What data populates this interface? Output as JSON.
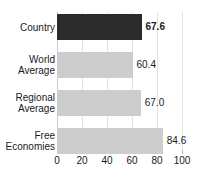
{
  "chart_data": {
    "type": "bar",
    "orientation": "horizontal",
    "title": "",
    "xlabel": "",
    "ylabel": "",
    "xlim": [
      0,
      100
    ],
    "xticks": [
      "0",
      "20",
      "40",
      "60",
      "80",
      "100"
    ],
    "xtick_values": [
      0,
      20,
      40,
      60,
      80,
      100
    ],
    "grid": true,
    "legend": "none",
    "categories": [
      "Country",
      "World Average",
      "Regional Average",
      "Free Economies"
    ],
    "values": [
      67.6,
      60.4,
      67.0,
      84.6
    ],
    "value_labels": [
      "67.6",
      "60.4",
      "67.0",
      "84.6"
    ],
    "bars": [
      {
        "category": "Country",
        "label_line1": "Country",
        "label_line2": "",
        "value": 67.6,
        "value_label": "67.6",
        "highlighted": true,
        "bold_value": true,
        "color": "#2b2b2b"
      },
      {
        "category": "World Average",
        "label_line1": "World",
        "label_line2": "Average",
        "value": 60.4,
        "value_label": "60.4",
        "highlighted": false,
        "bold_value": false,
        "color": "#cdcdcd"
      },
      {
        "category": "Regional Average",
        "label_line1": "Regional",
        "label_line2": "Average",
        "value": 67.0,
        "value_label": "67.0",
        "highlighted": false,
        "bold_value": false,
        "color": "#cdcdcd"
      },
      {
        "category": "Free Economies",
        "label_line1": "Free",
        "label_line2": "Economies",
        "value": 84.6,
        "value_label": "84.6",
        "highlighted": false,
        "bold_value": false,
        "color": "#cdcdcd"
      }
    ],
    "colors": {
      "highlight_bar": "#2b2b2b",
      "normal_bar": "#cdcdcd",
      "gridline": "#e2e2e2",
      "axis": "#c9c9c9",
      "text": "#1a1a1a",
      "background": "#ffffff"
    }
  }
}
